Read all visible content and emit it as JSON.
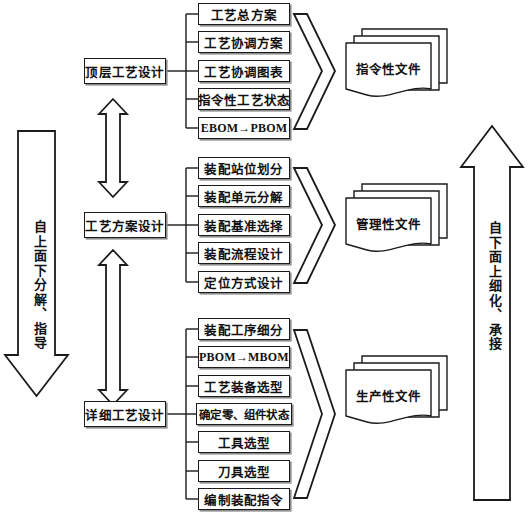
{
  "diagram": {
    "colors": {
      "stroke": "#1b1b1b",
      "shadow": "#8d8d8d",
      "fill": "#ffffff",
      "text": "#111111"
    },
    "left_arrow": {
      "label": "自上面下分解、指导",
      "direction": "down"
    },
    "right_arrow": {
      "label": "自下面上细化、承接",
      "direction": "up"
    },
    "groups": [
      {
        "id": "top-level",
        "stage": "顶层工艺设计",
        "document": "指令性文件",
        "items": [
          "工艺总方案",
          "工艺协调方案",
          "工艺协调图表",
          "指令性工艺状态",
          "EBOM→PBOM"
        ]
      },
      {
        "id": "scheme-level",
        "stage": "工艺方案设计",
        "document": "管理性文件",
        "items": [
          "装配站位划分",
          "装配单元分解",
          "装配基准选择",
          "装配流程设计",
          "定位方式设计"
        ]
      },
      {
        "id": "detail-level",
        "stage": "详细工艺设计",
        "document": "生产性文件",
        "items": [
          "装配工序细分",
          "PBOM→MBOM",
          "工艺装备选型",
          "确定零、组件状态",
          "工具选型",
          "刀具选型",
          "编制装配指令"
        ]
      }
    ],
    "connectors": {
      "between_stage_1_2": "double-headed-vertical-arrow",
      "between_stage_2_3": "double-headed-vertical-arrow",
      "group_to_document": "chevron-right"
    }
  }
}
